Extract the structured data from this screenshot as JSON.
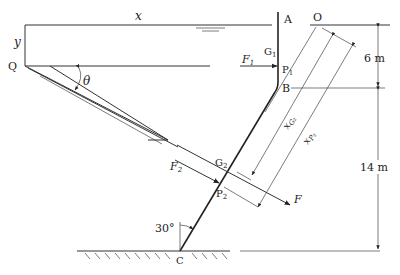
{
  "diagram": {
    "labels": {
      "x_axis": "x",
      "y_axis": "y",
      "point_Q": "Q",
      "angle_theta": "θ",
      "point_A": "A",
      "point_O": "O",
      "point_G1": "G",
      "point_G1_sub": "1",
      "point_P1": "P",
      "point_P1_sub": "1",
      "force_F1": "F",
      "force_F1_sub": "1",
      "point_B": "B",
      "dim_6m": "6 m",
      "dim_14m": "14 m",
      "x_G2": "x",
      "x_G2_sub": "G₂",
      "x_P2": "x",
      "x_P2_sub": "P₂",
      "point_G2": "G",
      "point_G2_sub": "2",
      "point_P2": "P",
      "point_P2_sub": "2",
      "force_F2": "F",
      "force_F2_sub": "2",
      "force_F": "F",
      "angle_30": "30°",
      "point_C": "C"
    },
    "dimensions": {
      "upper_wall_depth_m": 6,
      "lower_wall_depth_m": 14,
      "inclination_deg": 30
    }
  }
}
